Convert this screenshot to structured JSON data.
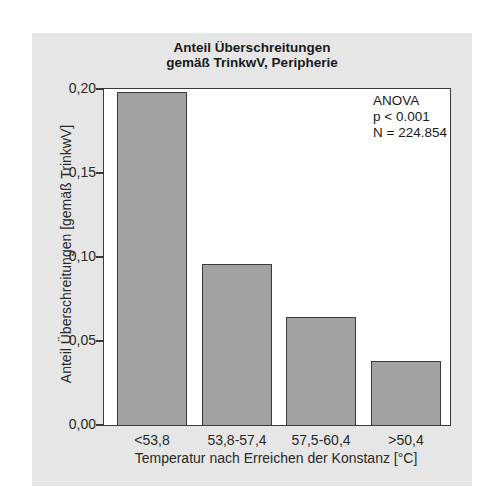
{
  "chart_data": {
    "type": "bar",
    "title": "Anteil Überschreitungen gemäß TrinkwV, Peripherie",
    "title_lines": [
      "Anteil Überschreitungen",
      "gemäß TrinkwV, Peripherie"
    ],
    "xlabel": "Temperatur nach Erreichen der Konstanz [°C]",
    "ylabel": "Anteil Überschreitungen [gemäß TrinkwV]",
    "categories": [
      "<53,8",
      "53,8-57,4",
      "57,5-60,4",
      ">50,4"
    ],
    "values": [
      0.198,
      0.096,
      0.064,
      0.038
    ],
    "ylim": [
      0,
      0.2
    ],
    "yticks": [
      0.0,
      0.05,
      0.1,
      0.15,
      0.2
    ],
    "ytick_labels": [
      "0,00",
      "0,05",
      "0,10",
      "0,15",
      "0,20"
    ],
    "annotations": [
      "ANOVA",
      "p < 0.001",
      "N = 224.854"
    ],
    "grid": false,
    "legend": null,
    "bar_color": "#a2a2a2",
    "background_color": "#e6e6e6"
  }
}
